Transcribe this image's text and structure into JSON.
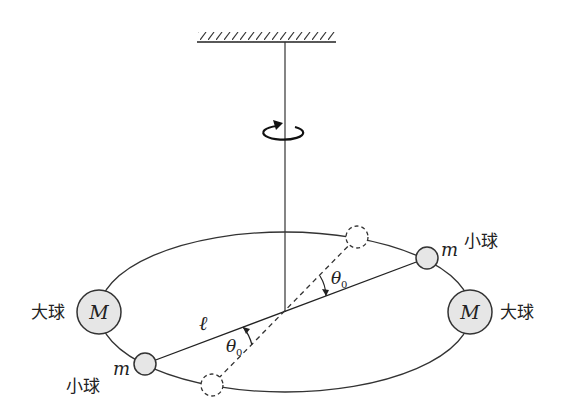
{
  "diagram": {
    "type": "torsion-balance",
    "labels": {
      "big_ball_left": "大球",
      "big_ball_right": "大球",
      "small_ball_upper": "小球",
      "small_ball_lower": "小球",
      "big_mass": "M",
      "small_mass": "m",
      "rod_length": "ℓ",
      "angle_upper": "θ",
      "angle_upper_sub": "0",
      "angle_lower": "θ",
      "angle_lower_sub": "0"
    },
    "colors": {
      "stroke": "#222222",
      "ball_fill": "#e6e6e6",
      "background": "#ffffff"
    }
  }
}
